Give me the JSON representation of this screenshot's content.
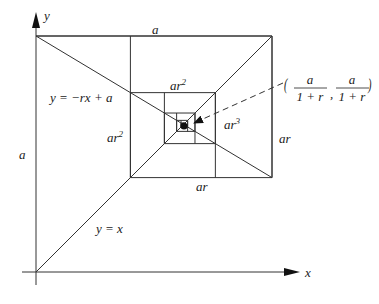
{
  "diagram": {
    "axes": {
      "x_label": "x",
      "y_label": "y"
    },
    "lines": {
      "diagonal_label": "y = x",
      "decreasing_label": "y = −rx + a"
    },
    "side_labels": {
      "top": "a",
      "left": "a",
      "right": "ar",
      "bottom": "ar",
      "inner_top": "ar",
      "inner_top_exp": "2",
      "inner_left": "ar",
      "inner_left_exp": "2",
      "inner_right": "ar",
      "inner_right_exp": "3"
    },
    "limit_point": {
      "numerator": "a",
      "denominator": "1 + r",
      "separator": ","
    },
    "parameters": {
      "r": 0.6
    }
  }
}
